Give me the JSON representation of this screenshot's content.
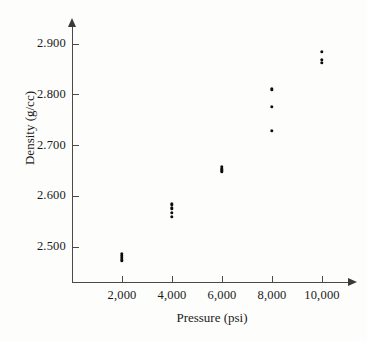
{
  "chart_data": {
    "type": "scatter",
    "title": "",
    "xlabel": "Pressure (psi)",
    "ylabel": "Density (g/cc)",
    "xlim": [
      0,
      11200
    ],
    "ylim": [
      2.43,
      2.935
    ],
    "grid": false,
    "legend": null,
    "xticks": [
      2000,
      4000,
      6000,
      8000,
      10000
    ],
    "xticklabels": [
      "2,000",
      "4,000",
      "6,000",
      "8,000",
      "10,000"
    ],
    "yticks": [
      2.5,
      2.6,
      2.7,
      2.8,
      2.9
    ],
    "yticklabels": [
      "2.500",
      "2.600",
      "2.700",
      "2.800",
      "2.900"
    ],
    "marker": "filled-circle",
    "marker_color": "#0d0d0d",
    "axis_color": "#4a4a4a",
    "background_color": "#fdfdfc",
    "points": [
      {
        "x": 2000,
        "y": 2.486
      },
      {
        "x": 2000,
        "y": 2.482
      },
      {
        "x": 2000,
        "y": 2.478
      },
      {
        "x": 2000,
        "y": 2.473
      },
      {
        "x": 4000,
        "y": 2.583
      },
      {
        "x": 4000,
        "y": 2.575
      },
      {
        "x": 4000,
        "y": 2.567
      },
      {
        "x": 4000,
        "y": 2.559
      },
      {
        "x": 6000,
        "y": 2.657
      },
      {
        "x": 6000,
        "y": 2.653
      },
      {
        "x": 6000,
        "y": 2.65
      },
      {
        "x": 6000,
        "y": 2.647
      },
      {
        "x": 8000,
        "y": 2.81
      },
      {
        "x": 8000,
        "y": 2.776
      },
      {
        "x": 8000,
        "y": 2.728
      },
      {
        "x": 10000,
        "y": 2.884
      },
      {
        "x": 10000,
        "y": 2.868
      },
      {
        "x": 10000,
        "y": 2.862
      }
    ]
  }
}
